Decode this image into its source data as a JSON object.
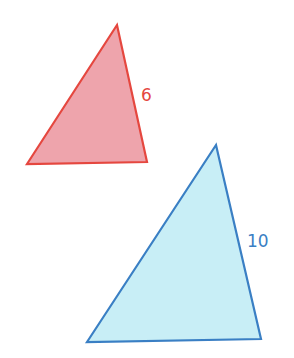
{
  "figure": {
    "triangles": [
      {
        "id": "small",
        "label": "6",
        "stroke": "#e5473f",
        "fill": "#eea4ac",
        "points": [
          [
            117,
            25
          ],
          [
            27,
            164
          ],
          [
            147,
            162
          ]
        ],
        "label_pos": [
          141,
          101
        ]
      },
      {
        "id": "large",
        "label": "10",
        "stroke": "#3a7fc4",
        "fill": "#c8eef6",
        "points": [
          [
            216,
            145
          ],
          [
            87,
            342
          ],
          [
            261,
            339
          ]
        ],
        "label_pos": [
          247,
          247
        ]
      }
    ]
  }
}
